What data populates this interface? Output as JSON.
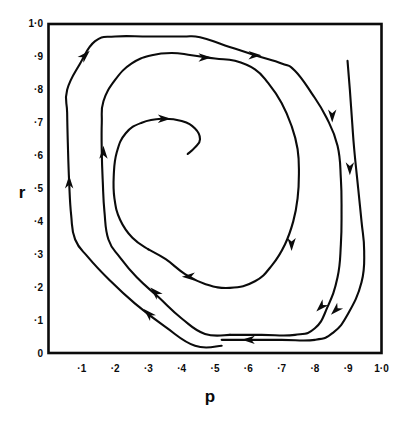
{
  "figure": {
    "background_color": "#ffffff",
    "ink_color": "#0b0b0b",
    "width": 412,
    "height": 423
  },
  "chart_data": {
    "type": "line",
    "title": "",
    "subtitle": "",
    "xlabel": "p",
    "ylabel": "r",
    "xlim": [
      0,
      1.0
    ],
    "ylim": [
      0,
      1.0
    ],
    "grid": false,
    "legend": "none",
    "annotations": [
      "Inward spiral trajectory with direction arrows",
      "Motion proceeds clockwise on the page: up the left side, right across the top, down the right side, left across the bottom"
    ],
    "x_ticks": [
      0.1,
      0.2,
      0.3,
      0.4,
      0.5,
      0.6,
      0.7,
      0.8,
      0.9,
      1.0
    ],
    "x_tick_labels": [
      "·1",
      "·2",
      "·3",
      "·4",
      "·5",
      "·6",
      "·7",
      "·8",
      "·9",
      "1·0"
    ],
    "y_ticks": [
      0.0,
      0.1,
      0.2,
      0.3,
      0.4,
      0.5,
      0.6,
      0.7,
      0.8,
      0.9,
      1.0
    ],
    "y_tick_labels": [
      "0",
      "·1",
      "·2",
      "·3",
      "·4",
      "·5",
      "·6",
      "·7",
      "·8",
      "·9",
      "1·0"
    ],
    "series": [
      {
        "name": "outer-turn",
        "comment": "Outermost arc: enters top right, sweeps down right side and left along the bottom",
        "points": [
          [
            0.898,
            0.888
          ],
          [
            0.905,
            0.8
          ],
          [
            0.912,
            0.7
          ],
          [
            0.918,
            0.62
          ],
          [
            0.93,
            0.5
          ],
          [
            0.94,
            0.4
          ],
          [
            0.948,
            0.31
          ],
          [
            0.94,
            0.215
          ],
          [
            0.9,
            0.12
          ],
          [
            0.855,
            0.062
          ],
          [
            0.8,
            0.04
          ],
          [
            0.7,
            0.04
          ],
          [
            0.6,
            0.04
          ],
          [
            0.52,
            0.04
          ]
        ]
      },
      {
        "name": "middle-turn",
        "comment": "Second winding: up the left side, across the top, down the right side, back left across the bottom",
        "points": [
          [
            0.52,
            0.022
          ],
          [
            0.44,
            0.022
          ],
          [
            0.35,
            0.08
          ],
          [
            0.26,
            0.15
          ],
          [
            0.18,
            0.225
          ],
          [
            0.12,
            0.29
          ],
          [
            0.08,
            0.345
          ],
          [
            0.068,
            0.42
          ],
          [
            0.062,
            0.52
          ],
          [
            0.058,
            0.64
          ],
          [
            0.056,
            0.73
          ],
          [
            0.056,
            0.8
          ],
          [
            0.095,
            0.88
          ],
          [
            0.14,
            0.948
          ],
          [
            0.2,
            0.962
          ],
          [
            0.3,
            0.962
          ],
          [
            0.4,
            0.962
          ],
          [
            0.455,
            0.96
          ],
          [
            0.53,
            0.935
          ],
          [
            0.62,
            0.905
          ],
          [
            0.7,
            0.88
          ],
          [
            0.74,
            0.858
          ],
          [
            0.79,
            0.79
          ],
          [
            0.835,
            0.715
          ],
          [
            0.868,
            0.63
          ],
          [
            0.878,
            0.53
          ],
          [
            0.88,
            0.43
          ],
          [
            0.878,
            0.33
          ],
          [
            0.868,
            0.23
          ],
          [
            0.838,
            0.14
          ],
          [
            0.8,
            0.075
          ],
          [
            0.74,
            0.055
          ],
          [
            0.64,
            0.055
          ],
          [
            0.545,
            0.055
          ]
        ]
      },
      {
        "name": "inner-turn",
        "comment": "Third winding, tighter: rises on the left, crosses the top, descends on the right, returns left low",
        "points": [
          [
            0.545,
            0.055
          ],
          [
            0.47,
            0.058
          ],
          [
            0.4,
            0.105
          ],
          [
            0.33,
            0.17
          ],
          [
            0.265,
            0.23
          ],
          [
            0.215,
            0.29
          ],
          [
            0.18,
            0.345
          ],
          [
            0.168,
            0.43
          ],
          [
            0.163,
            0.52
          ],
          [
            0.16,
            0.61
          ],
          [
            0.16,
            0.7
          ],
          [
            0.165,
            0.765
          ],
          [
            0.2,
            0.83
          ],
          [
            0.25,
            0.88
          ],
          [
            0.31,
            0.905
          ],
          [
            0.37,
            0.912
          ],
          [
            0.43,
            0.905
          ],
          [
            0.5,
            0.895
          ],
          [
            0.56,
            0.888
          ],
          [
            0.62,
            0.862
          ],
          [
            0.66,
            0.82
          ],
          [
            0.7,
            0.76
          ],
          [
            0.73,
            0.69
          ],
          [
            0.748,
            0.62
          ],
          [
            0.752,
            0.545
          ],
          [
            0.748,
            0.47
          ],
          [
            0.735,
            0.4
          ],
          [
            0.71,
            0.33
          ],
          [
            0.672,
            0.268
          ],
          [
            0.62,
            0.218
          ],
          [
            0.545,
            0.198
          ],
          [
            0.47,
            0.21
          ],
          [
            0.41,
            0.24
          ],
          [
            0.352,
            0.285
          ],
          [
            0.3,
            0.315
          ]
        ]
      },
      {
        "name": "innermost-turn",
        "comment": "Final short winding spiralling toward the focus near p≈·42, r≈·60",
        "points": [
          [
            0.3,
            0.315
          ],
          [
            0.252,
            0.35
          ],
          [
            0.215,
            0.405
          ],
          [
            0.198,
            0.47
          ],
          [
            0.196,
            0.54
          ],
          [
            0.205,
            0.61
          ],
          [
            0.232,
            0.668
          ],
          [
            0.28,
            0.7
          ],
          [
            0.34,
            0.712
          ],
          [
            0.4,
            0.705
          ],
          [
            0.44,
            0.682
          ],
          [
            0.455,
            0.65
          ],
          [
            0.44,
            0.625
          ],
          [
            0.418,
            0.605
          ]
        ]
      }
    ],
    "arrows": [
      {
        "at": [
          0.905,
          0.56
        ],
        "direction": "down",
        "on": "outer-turn"
      },
      {
        "at": [
          0.862,
          0.13
        ],
        "direction": "down-left",
        "on": "outer-turn"
      },
      {
        "at": [
          0.6,
          0.04
        ],
        "direction": "left",
        "on": "outer-turn"
      },
      {
        "at": [
          0.3,
          0.12
        ],
        "direction": "up-left",
        "on": "middle-turn"
      },
      {
        "at": [
          0.062,
          0.52
        ],
        "direction": "up",
        "on": "middle-turn"
      },
      {
        "at": [
          0.11,
          0.905
        ],
        "direction": "up-right",
        "on": "middle-turn"
      },
      {
        "at": [
          0.62,
          0.905
        ],
        "direction": "right",
        "on": "middle-turn"
      },
      {
        "at": [
          0.852,
          0.72
        ],
        "direction": "down",
        "on": "middle-turn"
      },
      {
        "at": [
          0.818,
          0.14
        ],
        "direction": "down-left",
        "on": "middle-turn"
      },
      {
        "at": [
          0.32,
          0.185
        ],
        "direction": "up-left",
        "on": "inner-turn"
      },
      {
        "at": [
          0.165,
          0.61
        ],
        "direction": "up",
        "on": "inner-turn"
      },
      {
        "at": [
          0.47,
          0.898
        ],
        "direction": "right",
        "on": "inner-turn"
      },
      {
        "at": [
          0.73,
          0.33
        ],
        "direction": "down",
        "on": "inner-turn"
      },
      {
        "at": [
          0.42,
          0.232
        ],
        "direction": "left",
        "on": "inner-turn"
      },
      {
        "at": [
          0.348,
          0.712
        ],
        "direction": "right",
        "on": "innermost-turn"
      }
    ]
  },
  "axes": {
    "x_title": "p",
    "y_title": "r"
  }
}
